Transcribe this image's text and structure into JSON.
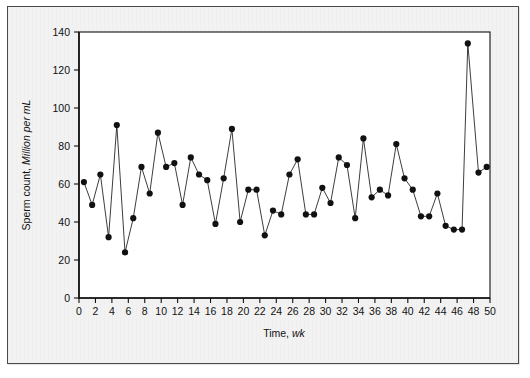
{
  "figure": {
    "background_color": "#f2f2f2",
    "plot_background_color": "#ffffff",
    "border_color": "#4a4a4a",
    "marker_color": "#111111",
    "line_color": "#1a1a1a"
  },
  "chart_data": {
    "type": "line",
    "title": "",
    "subtitle": "",
    "xlabel": "Time,",
    "xlabel_italic": "wk",
    "ylabel": "Sperm count,",
    "ylabel_italic": "Million per mL",
    "xlim": [
      0,
      50
    ],
    "ylim": [
      0,
      140
    ],
    "xticks": [
      0,
      2,
      4,
      6,
      8,
      10,
      12,
      14,
      16,
      18,
      20,
      22,
      24,
      26,
      28,
      30,
      32,
      34,
      36,
      38,
      40,
      42,
      44,
      46,
      48,
      50
    ],
    "yticks": [
      0,
      20,
      40,
      60,
      80,
      100,
      120,
      140
    ],
    "xtick_labels": [
      "0",
      "2",
      "4",
      "6",
      "8",
      "10",
      "12",
      "14",
      "16",
      "18",
      "20",
      "22",
      "24",
      "26",
      "28",
      "30",
      "32",
      "34",
      "36",
      "38",
      "40",
      "42",
      "44",
      "46",
      "48",
      "50"
    ],
    "ytick_labels": [
      "0",
      "20",
      "40",
      "60",
      "80",
      "100",
      "120",
      "140"
    ],
    "grid": false,
    "legend": false,
    "legend_position": "none",
    "marker": "filled-circle",
    "series": [
      {
        "name": "Sperm count",
        "x": [
          0.6,
          1.6,
          2.6,
          3.6,
          4.6,
          5.6,
          6.6,
          7.6,
          8.6,
          9.6,
          10.6,
          11.6,
          12.6,
          13.6,
          14.6,
          15.6,
          16.6,
          17.6,
          18.6,
          19.6,
          20.6,
          21.6,
          22.6,
          23.6,
          24.6,
          25.6,
          26.6,
          27.6,
          28.6,
          29.6,
          30.6,
          31.6,
          32.6,
          33.6,
          34.6,
          35.6,
          36.6,
          37.6,
          38.6,
          39.6,
          40.6,
          41.6,
          42.6,
          43.6,
          44.6,
          45.6,
          46.6,
          47.3,
          48.6,
          49.6
        ],
        "y": [
          61,
          49,
          65,
          32,
          91,
          24,
          42,
          69,
          55,
          87,
          69,
          71,
          49,
          74,
          65,
          62,
          39,
          63,
          89,
          40,
          57,
          57,
          33,
          46,
          44,
          65,
          73,
          44,
          44,
          58,
          50,
          74,
          70,
          42,
          84,
          53,
          57,
          54,
          81,
          63,
          57,
          43,
          43,
          55,
          38,
          36,
          36,
          134,
          66,
          69
        ]
      }
    ]
  }
}
